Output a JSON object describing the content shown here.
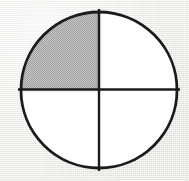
{
  "figure": {
    "title": "Circle divided into four equal quadrants with one quadrant shaded",
    "caption": "",
    "background_color": "#ededeb"
  },
  "chart_data": {
    "type": "pie",
    "title": "Circle divided into four equal quadrants with one quadrant shaded",
    "subtitle": "",
    "xlabel": "",
    "ylabel": "",
    "categories": [
      "upper-left",
      "upper-right",
      "lower-right",
      "lower-left"
    ],
    "values": [
      25,
      25,
      25,
      25
    ],
    "value_unit": "percent",
    "slices": [
      {
        "name": "upper-left",
        "label": "",
        "value": 25,
        "fraction": "1/4",
        "start_angle_deg": 180,
        "end_angle_deg": 270,
        "shaded": true,
        "fill": "#b9b9b9",
        "fill_style": "halftone-dither-gray"
      },
      {
        "name": "upper-right",
        "label": "",
        "value": 25,
        "fraction": "1/4",
        "start_angle_deg": 270,
        "end_angle_deg": 360,
        "shaded": false,
        "fill": "#ffffff",
        "fill_style": "solid-white"
      },
      {
        "name": "lower-right",
        "label": "",
        "value": 25,
        "fraction": "1/4",
        "start_angle_deg": 0,
        "end_angle_deg": 90,
        "shaded": false,
        "fill": "#ffffff",
        "fill_style": "solid-white"
      },
      {
        "name": "lower-left",
        "label": "",
        "value": 25,
        "fraction": "1/4",
        "start_angle_deg": 90,
        "end_angle_deg": 180,
        "shaded": false,
        "fill": "#ffffff",
        "fill_style": "solid-white"
      }
    ],
    "shaded_count": 1,
    "total_parts": 4,
    "shaded_fraction": "1/4",
    "legend": [],
    "legend_position": "none",
    "grid": false,
    "annotations": [],
    "tick_labels": [],
    "geometry": {
      "center_x": 99,
      "center_y": 90,
      "radius": 78,
      "stroke_color": "#1b1b1b",
      "outline_stroke_width": 2.8,
      "divider_stroke_width": 2.4,
      "divider_overhang_px": 3,
      "dividers": [
        "vertical-diameter",
        "horizontal-diameter"
      ]
    }
  }
}
